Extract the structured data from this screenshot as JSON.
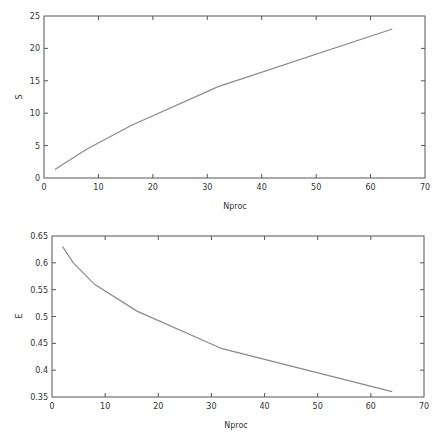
{
  "chart_data": [
    {
      "type": "line",
      "title": "",
      "xlabel": "Nproc",
      "ylabel": "S",
      "xlim": [
        0,
        70
      ],
      "ylim": [
        0,
        25
      ],
      "xticks": [
        0,
        10,
        20,
        30,
        40,
        50,
        60,
        70
      ],
      "yticks": [
        0,
        5,
        10,
        15,
        20,
        25
      ],
      "xtick_labels": [
        "0",
        "10",
        "20",
        "30",
        "40",
        "50",
        "60",
        "70"
      ],
      "ytick_labels": [
        "0",
        "5",
        "10",
        "15",
        "20",
        "25"
      ],
      "grid": false,
      "legend": "none",
      "series": [
        {
          "name": "S",
          "x": [
            2,
            4,
            8,
            16,
            32,
            64
          ],
          "y": [
            1.3,
            2.4,
            4.5,
            8.1,
            14.1,
            23.0
          ]
        }
      ]
    },
    {
      "type": "line",
      "title": "",
      "xlabel": "Nproc",
      "ylabel": "E",
      "xlim": [
        0,
        70
      ],
      "ylim": [
        0.35,
        0.65
      ],
      "xticks": [
        0,
        10,
        20,
        30,
        40,
        50,
        60,
        70
      ],
      "yticks": [
        0.35,
        0.4,
        0.45,
        0.5,
        0.55,
        0.6,
        0.65
      ],
      "xtick_labels": [
        "0",
        "10",
        "20",
        "30",
        "40",
        "50",
        "60",
        "70"
      ],
      "ytick_labels": [
        "0.35",
        "0.4",
        "0.45",
        "0.5",
        "0.55",
        "0.6",
        "0.65"
      ],
      "grid": false,
      "legend": "none",
      "series": [
        {
          "name": "E",
          "x": [
            2,
            4,
            8,
            16,
            32,
            64
          ],
          "y": [
            0.63,
            0.6,
            0.56,
            0.51,
            0.44,
            0.36
          ]
        }
      ]
    }
  ]
}
